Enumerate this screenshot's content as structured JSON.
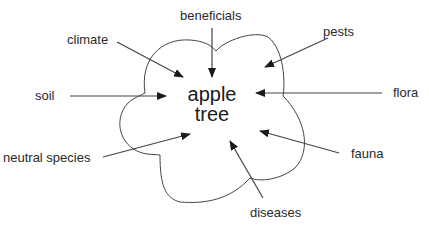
{
  "diagram": {
    "center": {
      "line1": "apple",
      "line2": "tree"
    },
    "factors": {
      "beneficials": "beneficials",
      "climate": "climate",
      "pests": "pests",
      "soil": "soil",
      "flora": "flora",
      "neutral_species": "neutral species",
      "fauna": "fauna",
      "diseases": "diseases"
    },
    "colors": {
      "line": "#444444",
      "text": "#2a2a2a"
    }
  }
}
